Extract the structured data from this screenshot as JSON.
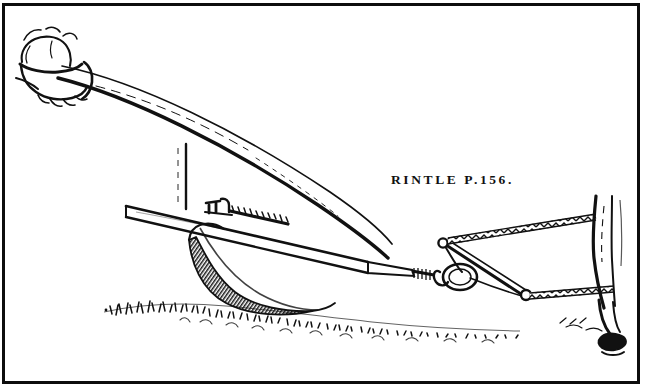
{
  "plate": {
    "caption": "RINTLE P.156.",
    "caption_parts": {
      "word": "RINTLE",
      "page_reference": "P.156."
    },
    "ink_color": "#111111",
    "paper_color": "#ffffff",
    "frame_color": "#0d0d0d"
  },
  "scene": {
    "subject": "horse-drawn plough with ploughman's hand on the handle",
    "elements": {
      "hand": "hand-and-cuff",
      "handle": "plough-handle",
      "beam": "plough-beam",
      "cross_beam": "plough-cross-beam",
      "brace": "vertical-brace",
      "coulter_bracket": "coulter-bracket",
      "toothed_rack": "toothed-rack",
      "mouldboard": "shaded-mouldboard-share",
      "ground": "grass-and-soil",
      "swingletree": "swingletree",
      "hitch_ring": "hitch-ring",
      "chain_upper": "upper-trace-chain",
      "chain_lower": "lower-trace-chain",
      "horse_leg": "horse-hind-leg",
      "horse_hoof": "horse-hoof"
    }
  }
}
